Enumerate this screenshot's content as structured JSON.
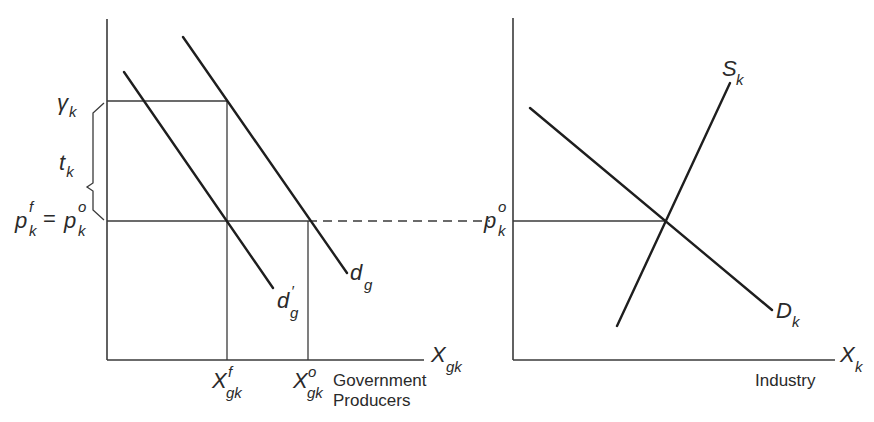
{
  "diagram": {
    "left_panel": {
      "title": "Government Producers",
      "caption_line1": "Government",
      "caption_line2": "Producers",
      "x_axis": {
        "base": "X",
        "sub": "gk"
      },
      "y_labels": {
        "gamma": {
          "base": "γ",
          "sub": "k"
        },
        "tax": {
          "base": "t",
          "sub": "k"
        },
        "price_lhs": {
          "base": "p",
          "sup": "f",
          "sub": "k"
        },
        "equals": "=",
        "price_rhs": {
          "base": "p",
          "sup": "o",
          "sub": "k"
        }
      },
      "x_ticks": {
        "xf": {
          "base": "X",
          "sup": "f",
          "sub": "gk"
        },
        "xo": {
          "base": "X",
          "sup": "o",
          "sub": "gk"
        }
      },
      "curves": {
        "dg_prime": {
          "base": "d",
          "sup": "′",
          "sub": "g"
        },
        "dg": {
          "base": "d",
          "sub": "g"
        }
      }
    },
    "right_panel": {
      "caption": "Industry",
      "x_axis": {
        "base": "X",
        "sub": "k"
      },
      "y_label": {
        "base": "p",
        "sup": "o",
        "sub": "k"
      },
      "curves": {
        "supply": {
          "base": "S",
          "sub": "k"
        },
        "demand": {
          "base": "D",
          "sub": "k"
        }
      }
    }
  }
}
